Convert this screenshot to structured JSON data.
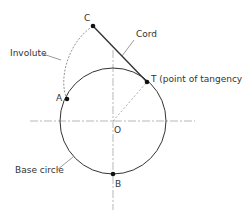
{
  "diagram": {
    "type": "involute-construction",
    "labels": {
      "C": "C",
      "A": "A",
      "T": "T (point of tangency)",
      "O": "O",
      "B": "B",
      "cord": "Cord",
      "involute": "Involute",
      "base_circle": "Base circle"
    },
    "points": {
      "C": [
        93,
        26
      ],
      "T": [
        147,
        82
      ],
      "O": [
        113,
        121
      ],
      "A": [
        67,
        99
      ],
      "B": [
        113,
        174
      ]
    },
    "circle": {
      "cx": 113,
      "cy": 121,
      "r": 53
    },
    "colors": {
      "stroke": "#333333",
      "dashed": "#888888",
      "text": "#333333"
    }
  }
}
